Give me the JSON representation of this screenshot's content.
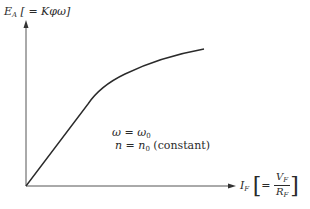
{
  "diagram": {
    "y_axis": {
      "symbol": "E",
      "subscript": "A",
      "relation": " [ = Kφω]"
    },
    "x_axis": {
      "symbol": "I",
      "subscript": "F",
      "eq": "=",
      "numerator_symbol": "V",
      "numerator_sub": "F",
      "denominator_symbol": "R",
      "denominator_sub": "F",
      "open_bracket": "[",
      "close_bracket": "]"
    },
    "annotation": {
      "line1_lhs": "ω",
      "line1_eq": " = ",
      "line1_rhs": "ω",
      "line1_rhs_sub": "0",
      "line2_lhs": "n",
      "line2_eq": " = ",
      "line2_rhs": "n",
      "line2_rhs_sub": "0",
      "line2_suffix": " (constant)"
    },
    "curve": {
      "description": "Magnetization curve: linear rise from origin, knee, then saturating",
      "color": "#2a2a2a"
    }
  }
}
